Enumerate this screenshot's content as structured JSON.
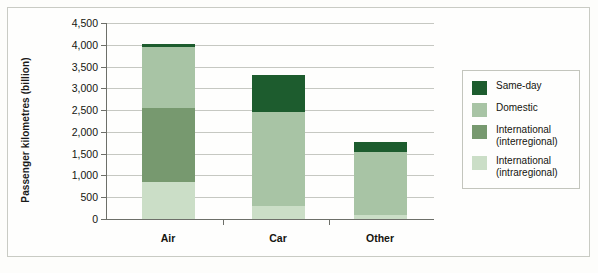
{
  "chart_data": {
    "type": "bar",
    "subtype": "stacked-bar",
    "title": "",
    "xlabel": "",
    "ylabel": "Passenger kilometres (billion)",
    "categories": [
      "Air",
      "Car",
      "Other"
    ],
    "ylim": [
      0,
      4500
    ],
    "yticks": [
      0,
      500,
      1000,
      1500,
      2000,
      2500,
      3000,
      3500,
      4000,
      4500
    ],
    "ytick_labels": [
      "0",
      "500",
      "1,000",
      "1,500",
      "2,000",
      "2,500",
      "3,000",
      "3,500",
      "4,000",
      "4,500"
    ],
    "grid": true,
    "legend_position": "right",
    "stack_order_bottom_to_top": [
      "International (intraregional)",
      "International (interregional)",
      "Domestic",
      "Same-day"
    ],
    "series": [
      {
        "name": "Same-day",
        "color": "#1d5c2e",
        "values": [
          50,
          850,
          210
        ]
      },
      {
        "name": "Domestic",
        "color": "#a8c4a5",
        "values": [
          1400,
          2150,
          1450
        ]
      },
      {
        "name": "International (interregional)",
        "color": "#77996f",
        "values": [
          1720,
          0,
          0
        ]
      },
      {
        "name": "International (intraregional)",
        "color": "#cbdec7",
        "values": [
          840,
          300,
          100
        ]
      }
    ],
    "totals": [
      4010,
      3300,
      1760
    ],
    "annotations": []
  },
  "legend": {
    "items": [
      {
        "label": "Same-day",
        "color": "#1d5c2e"
      },
      {
        "label": "Domestic",
        "color": "#a8c4a5"
      },
      {
        "label": "International\n(interregional)",
        "color": "#77996f"
      },
      {
        "label": "International\n(intraregional)",
        "color": "#cbdec7"
      }
    ]
  },
  "colors": {
    "same_day": "#1d5c2e",
    "domestic": "#a8c4a5",
    "international_interregional": "#77996f",
    "international_intraregional": "#cbdec7",
    "axis": "#6d6f69",
    "gridline": "#c6c8c2",
    "frame": "#c9cbc4",
    "background": "#fefefd",
    "text": "#15150f"
  }
}
